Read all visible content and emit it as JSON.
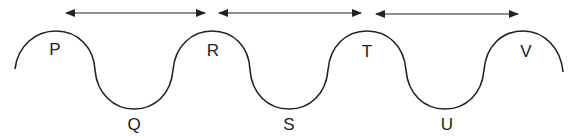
{
  "diagram": {
    "type": "wave",
    "colors": {
      "stroke": "#222222",
      "background": "#ffffff"
    },
    "crest_labels": [
      "P",
      "R",
      "T",
      "V"
    ],
    "trough_labels": [
      "Q",
      "S",
      "U"
    ],
    "labels": {
      "P": "P",
      "Q": "Q",
      "R": "R",
      "S": "S",
      "T": "T",
      "U": "U",
      "V": "V"
    },
    "arrows": [
      {
        "from": "P",
        "to": "R",
        "direction": "double-headed"
      },
      {
        "from": "R",
        "to": "T",
        "direction": "double-headed"
      },
      {
        "from": "T",
        "to": "V",
        "direction": "double-headed"
      }
    ]
  }
}
